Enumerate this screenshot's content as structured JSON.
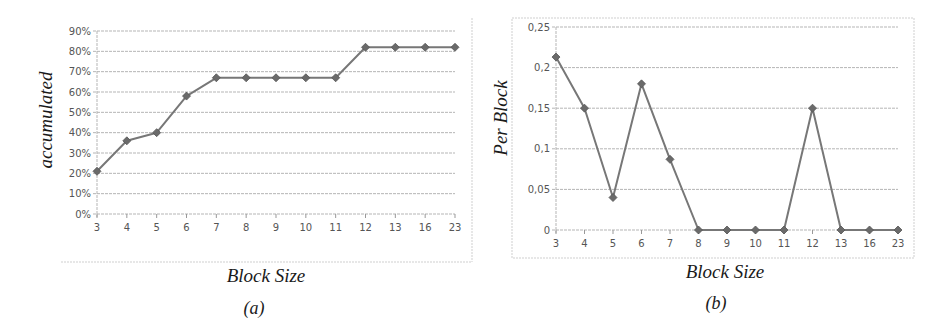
{
  "chart_data": [
    {
      "type": "line",
      "panel_label": "(a)",
      "title": "",
      "xlabel": "Block Size",
      "ylabel": "accumulated",
      "categories": [
        "3",
        "4",
        "5",
        "6",
        "7",
        "8",
        "9",
        "10",
        "11",
        "12",
        "13",
        "16",
        "23"
      ],
      "values": [
        21,
        36,
        40,
        58,
        67,
        67,
        67,
        67,
        67,
        82,
        82,
        82,
        82
      ],
      "y_ticks": [
        "0%",
        "10%",
        "20%",
        "30%",
        "40%",
        "50%",
        "60%",
        "70%",
        "80%",
        "90%"
      ],
      "ylim": [
        0,
        90
      ],
      "grid": true,
      "legend": null
    },
    {
      "type": "line",
      "panel_label": "(b)",
      "title": "",
      "xlabel": "Block Size",
      "ylabel": "Per Block",
      "categories": [
        "3",
        "4",
        "5",
        "6",
        "7",
        "8",
        "9",
        "10",
        "11",
        "12",
        "13",
        "16",
        "23"
      ],
      "values": [
        0.213,
        0.15,
        0.04,
        0.18,
        0.087,
        0,
        0,
        0,
        0,
        0.15,
        0,
        0,
        0
      ],
      "y_ticks": [
        "0",
        "0,05",
        "0,1",
        "0,15",
        "0,2",
        "0,25"
      ],
      "ylim": [
        0,
        0.25
      ],
      "grid": true,
      "legend": null
    }
  ],
  "colors": {
    "series": "#777777",
    "marker": "#6a6a6a",
    "grid": "#b5b5b5"
  }
}
